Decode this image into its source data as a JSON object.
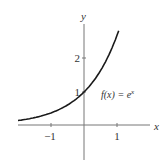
{
  "chart_data": {
    "type": "line",
    "title": "",
    "function_label": "f(x) = e^x",
    "function_label_parts": {
      "lhs": "f(x) = e",
      "sup": "x"
    },
    "xlabel": "x",
    "ylabel": "y",
    "xlim": [
      -1.95,
      2.0
    ],
    "ylim": [
      -1.8,
      3.3
    ],
    "x_ticks": [
      -1,
      1
    ],
    "x_tick_labels": [
      "−1",
      "1"
    ],
    "y_ticks": [
      1,
      2
    ],
    "y_tick_labels": [
      "1",
      "2"
    ],
    "grid": false,
    "series": [
      {
        "name": "f(x) = e^x",
        "x": [
          -2.0,
          -1.5,
          -1.0,
          -0.5,
          0.0,
          0.5,
          1.0,
          1.1
        ],
        "values": [
          0.135,
          0.223,
          0.368,
          0.607,
          1.0,
          1.649,
          2.718,
          3.004
        ]
      }
    ]
  },
  "style": {
    "axis_color": "#777777",
    "curve_color": "#1a1a1a"
  }
}
